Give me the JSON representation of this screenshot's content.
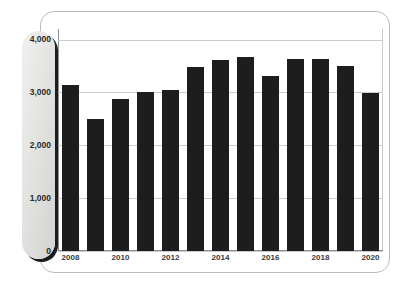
{
  "chart_data": {
    "type": "bar",
    "title": "",
    "subtitle": "",
    "xlabel": "",
    "ylabel": "Net Sales in Billion Yen",
    "categories": [
      "2008",
      "2009",
      "2010",
      "2011",
      "2012",
      "2013",
      "2014",
      "2015",
      "2016",
      "2017",
      "2018",
      "2019",
      "2020"
    ],
    "values": [
      3150,
      2500,
      2880,
      3000,
      3050,
      3480,
      3620,
      3680,
      3320,
      3630,
      3630,
      3500,
      2990
    ],
    "x_tick_labels": [
      "2008",
      "2010",
      "2012",
      "2014",
      "2016",
      "2018",
      "2020"
    ],
    "x_tick_categories": [
      "2008",
      "2010",
      "2012",
      "2014",
      "2016",
      "2018",
      "2020"
    ],
    "y_tick_labels": [
      "4,000",
      "3,000",
      "2,000",
      "1,000",
      "0"
    ],
    "y_tick_values": [
      4000,
      3000,
      2000,
      1000,
      0
    ],
    "ylim": [
      0,
      4200
    ],
    "grid": true,
    "legend": "none",
    "bar_color": "#1d1d1d",
    "gridline_color": "#c9cbcd",
    "axis_color": "#8d9093",
    "axis_label_color": "#77797c",
    "pill_color": "#e3e3e1"
  },
  "figure": {
    "caption": "",
    "frame_border_color": "#b9bcbe"
  }
}
